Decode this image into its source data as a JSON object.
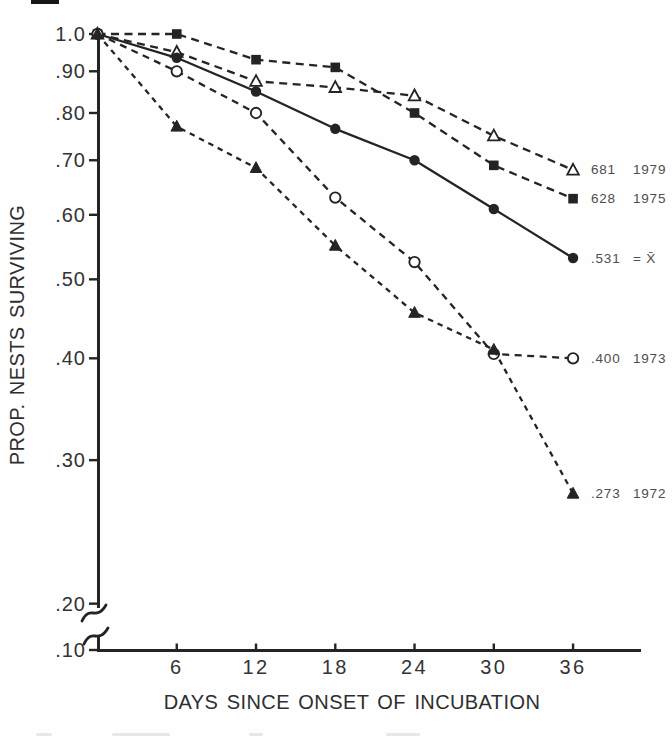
{
  "colors": {
    "ink": "#242424",
    "background": "#fefefe",
    "axis_text": "#333333",
    "legend_text": "#4d4d4d"
  },
  "chart_data": {
    "type": "line",
    "title": "",
    "xlabel": "DAYS SINCE ONSET OF INCUBATION",
    "ylabel": "PROP. NESTS SURVIVING",
    "xlim": [
      0,
      38
    ],
    "ylim": [
      0.1,
      1.0
    ],
    "yscale": "log10",
    "grid": false,
    "axis_break_between": [
      0.2,
      0.1
    ],
    "legend_position": "right-of-last-point",
    "x": [
      0,
      6,
      12,
      18,
      24,
      30,
      36
    ],
    "x_ticks": [
      6,
      12,
      18,
      24,
      30,
      36
    ],
    "y_ticks": [
      {
        "label": "1.0",
        "value": 1.0
      },
      {
        "label": ".90",
        "value": 0.9
      },
      {
        "label": ".80",
        "value": 0.8
      },
      {
        "label": ".70",
        "value": 0.7
      },
      {
        "label": ".60",
        "value": 0.6
      },
      {
        "label": ".50",
        "value": 0.5
      },
      {
        "label": ".40",
        "value": 0.4
      },
      {
        "label": ".30",
        "value": 0.3
      },
      {
        "label": ".20",
        "value": 0.2
      },
      {
        "label": ".10",
        "value": 0.1
      }
    ],
    "series": [
      {
        "name": "1979",
        "marker": "triangle-open",
        "line": "dashed-long",
        "values": [
          1.0,
          0.95,
          0.875,
          0.86,
          0.84,
          0.75,
          0.681
        ],
        "label_value": "681",
        "label_year": "1979"
      },
      {
        "name": "1975",
        "marker": "square-filled",
        "line": "dashed-long",
        "values": [
          1.0,
          1.0,
          0.93,
          0.91,
          0.8,
          0.69,
          0.628
        ],
        "label_value": "628",
        "label_year": "1975"
      },
      {
        "name": "mean",
        "marker": "circle-filled",
        "line": "solid",
        "values": [
          1.0,
          0.935,
          0.85,
          0.765,
          0.7,
          0.61,
          0.531
        ],
        "label_value": ".531",
        "label_year": "= X̄"
      },
      {
        "name": "1973",
        "marker": "circle-open",
        "line": "dashed-med",
        "values": [
          1.0,
          0.9,
          0.8,
          0.63,
          0.525,
          0.405,
          0.4
        ],
        "label_value": ".400",
        "label_year": "1973"
      },
      {
        "name": "1972",
        "marker": "triangle-filled",
        "line": "dashed-short",
        "values": [
          1.0,
          0.77,
          0.685,
          0.55,
          0.455,
          0.41,
          0.273
        ],
        "label_value": ".273",
        "label_year": "1972"
      }
    ]
  }
}
